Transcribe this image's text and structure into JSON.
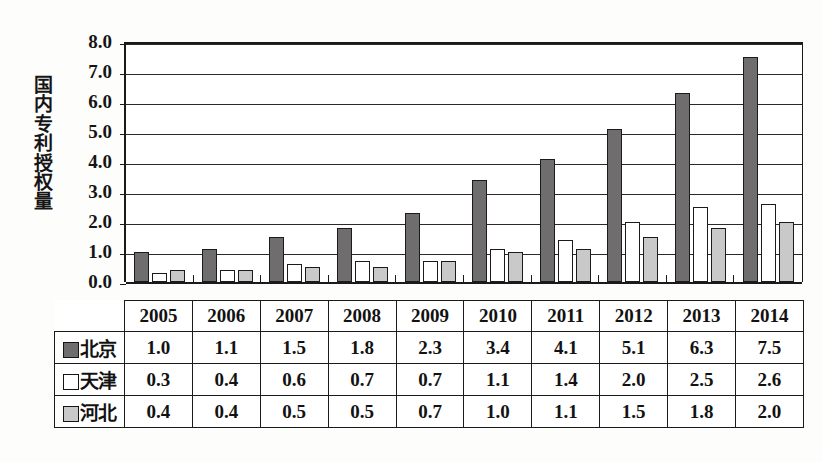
{
  "chart_data": {
    "type": "bar",
    "title": "",
    "subtitle": "",
    "xlabel": "",
    "ylabel": "国内专利授权量",
    "ylim": [
      0.0,
      8.0
    ],
    "ytick_step": 1.0,
    "ytick_labels": [
      "8.0",
      "7.0",
      "6.0",
      "5.0",
      "4.0",
      "3.0",
      "2.0",
      "1.0",
      "0.0"
    ],
    "ytick_values": [
      8.0,
      7.0,
      6.0,
      5.0,
      4.0,
      3.0,
      2.0,
      1.0,
      0.0
    ],
    "grid": true,
    "legend_position": "table-left-column",
    "categories": [
      "2005",
      "2006",
      "2007",
      "2008",
      "2009",
      "2010",
      "2011",
      "2012",
      "2013",
      "2014"
    ],
    "series": [
      {
        "name": "北京",
        "color": "#6f6d6d",
        "values": [
          1.0,
          1.1,
          1.5,
          1.8,
          2.3,
          3.4,
          4.1,
          5.1,
          6.3,
          7.5
        ]
      },
      {
        "name": "天津",
        "color": "#ffffff",
        "values": [
          0.3,
          0.4,
          0.6,
          0.7,
          0.7,
          1.1,
          1.4,
          2.0,
          2.5,
          2.6
        ]
      },
      {
        "name": "河北",
        "color": "#c9c9c9",
        "values": [
          0.4,
          0.4,
          0.5,
          0.5,
          0.7,
          1.0,
          1.1,
          1.5,
          1.8,
          2.0
        ]
      }
    ]
  },
  "table": {
    "header": [
      "2005",
      "2006",
      "2007",
      "2008",
      "2009",
      "2010",
      "2011",
      "2012",
      "2013",
      "2014"
    ],
    "rows": [
      {
        "label": "北京",
        "swatch": "dark-gray-swatch-icon",
        "cells": [
          "1.0",
          "1.1",
          "1.5",
          "1.8",
          "2.3",
          "3.4",
          "4.1",
          "5.1",
          "6.3",
          "7.5"
        ]
      },
      {
        "label": "天津",
        "swatch": "white-swatch-icon",
        "cells": [
          "0.3",
          "0.4",
          "0.6",
          "0.7",
          "0.7",
          "1.1",
          "1.4",
          "2.0",
          "2.5",
          "2.6"
        ]
      },
      {
        "label": "河北",
        "swatch": "light-gray-swatch-icon",
        "cells": [
          "0.4",
          "0.4",
          "0.5",
          "0.5",
          "0.7",
          "1.0",
          "1.1",
          "1.5",
          "1.8",
          "2.0"
        ]
      }
    ]
  },
  "colors": {
    "series_beijing": "#6f6d6d",
    "series_tianjin": "#ffffff",
    "series_hebei": "#c9c9c9",
    "axis": "#1a1a1a",
    "background": "#fdfdfb"
  }
}
